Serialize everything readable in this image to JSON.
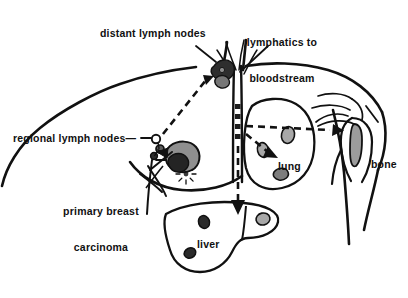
{
  "figure": {
    "type": "medical-illustration",
    "background_color": "#ffffff",
    "ink_color": "#111111",
    "lesion_fill_dark": "#3a3a3a",
    "lesion_fill_gray": "#a8a8a8"
  },
  "labels": {
    "distant_lymph_nodes": "distant lymph nodes",
    "lymphatics_to_bloodstream_line1": "lymphatics to",
    "lymphatics_to_bloodstream_line2": "bloodstream",
    "regional_lymph_nodes": "regional lymph nodes—",
    "primary_breast_carcinoma_line1": "primary breast",
    "primary_breast_carcinoma_line2": "carcinoma",
    "lung": "lung",
    "liver": "liver",
    "bone": "bone"
  },
  "anatomy": {
    "torso_outline": "female upper torso, head omitted, both shoulders and right arm shown",
    "central_vessel": "thoracic duct / great vein ascending midline with dashed tumor emboli inside",
    "structures": [
      "supraclavicular / distant lymph node cluster",
      "axillary regional lymph node chain",
      "primary breast carcinoma mass",
      "breast with nipple",
      "lung with metastatic nodules",
      "liver with metastatic nodules",
      "humerus with metastatic lesion",
      "clavicle and scapula"
    ]
  },
  "lesions": {
    "lung_nodules": 3,
    "liver_nodules": 3,
    "bone_lesions": 1,
    "regional_node_count": 3
  },
  "spread_routes": [
    {
      "name": "breast-to-regional-nodes",
      "style": "solid-arrow",
      "from": "primary breast carcinoma",
      "to": "regional lymph nodes"
    },
    {
      "name": "regional-to-distant-nodes",
      "style": "dashed-arrow",
      "from": "regional lymph nodes",
      "to": "distant lymph nodes"
    },
    {
      "name": "nodes-to-bloodstream",
      "style": "dashed-vertical",
      "from": "lymphatics",
      "to": "bloodstream"
    },
    {
      "name": "bloodstream-to-lung",
      "style": "dashed-arrow",
      "from": "bloodstream",
      "to": "lung"
    },
    {
      "name": "bloodstream-to-bone",
      "style": "dashed-arrow",
      "from": "bloodstream",
      "to": "bone"
    },
    {
      "name": "bloodstream-to-liver",
      "style": "dashed-arrow",
      "from": "bloodstream",
      "to": "liver"
    }
  ]
}
